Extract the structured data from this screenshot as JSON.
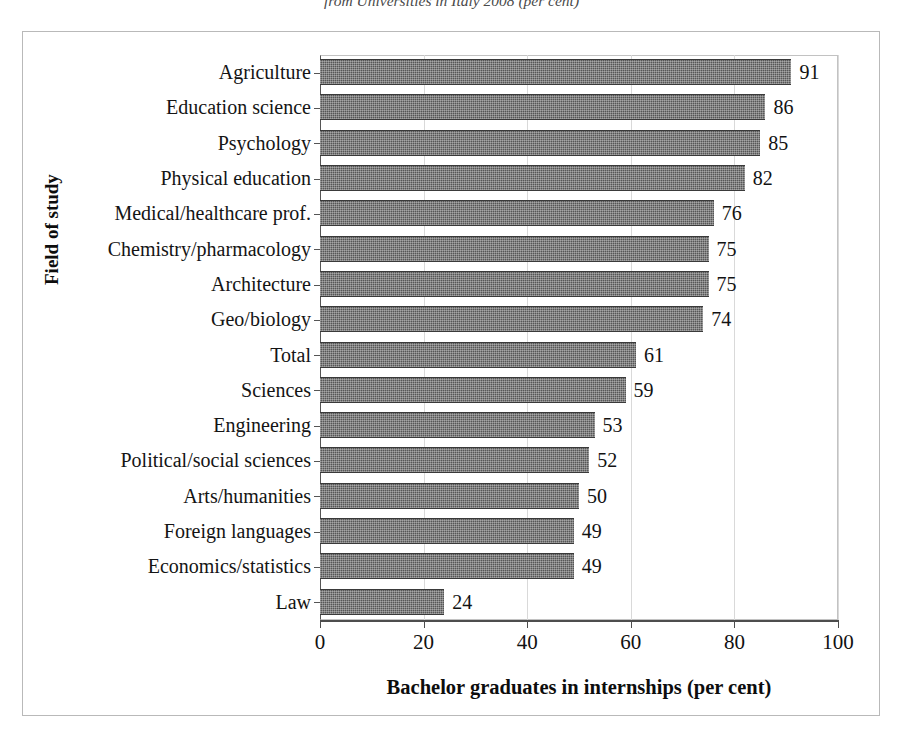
{
  "caption": {
    "text": "from Universities in Italy 2008 (per cent)"
  },
  "axis_titles": {
    "x": "Bachelor graduates in internships (per cent)",
    "y": "Field of study"
  },
  "chart_data": {
    "type": "bar",
    "orientation": "horizontal",
    "title": "",
    "subtitle": "",
    "xlabel": "Bachelor graduates in internships (per cent)",
    "ylabel": "Field of study",
    "xlim": [
      0,
      100
    ],
    "xticks": [
      0,
      20,
      40,
      60,
      80,
      100
    ],
    "grid": true,
    "legend": null,
    "bar_color": "#565656",
    "categories": [
      "Agriculture",
      "Education science",
      "Psychology",
      "Physical education",
      "Medical/healthcare prof.",
      "Chemistry/pharmacology",
      "Architecture",
      "Geo/biology",
      "Total",
      "Sciences",
      "Engineering",
      "Political/social sciences",
      "Arts/humanities",
      "Foreign languages",
      "Economics/statistics",
      "Law"
    ],
    "values": [
      91,
      86,
      85,
      82,
      76,
      75,
      75,
      74,
      61,
      59,
      53,
      52,
      50,
      49,
      49,
      24
    ],
    "data_labels": [
      "91",
      "86",
      "85",
      "82",
      "76",
      "75",
      "75",
      "74",
      "61",
      "59",
      "53",
      "52",
      "50",
      "49",
      "49",
      "24"
    ]
  }
}
